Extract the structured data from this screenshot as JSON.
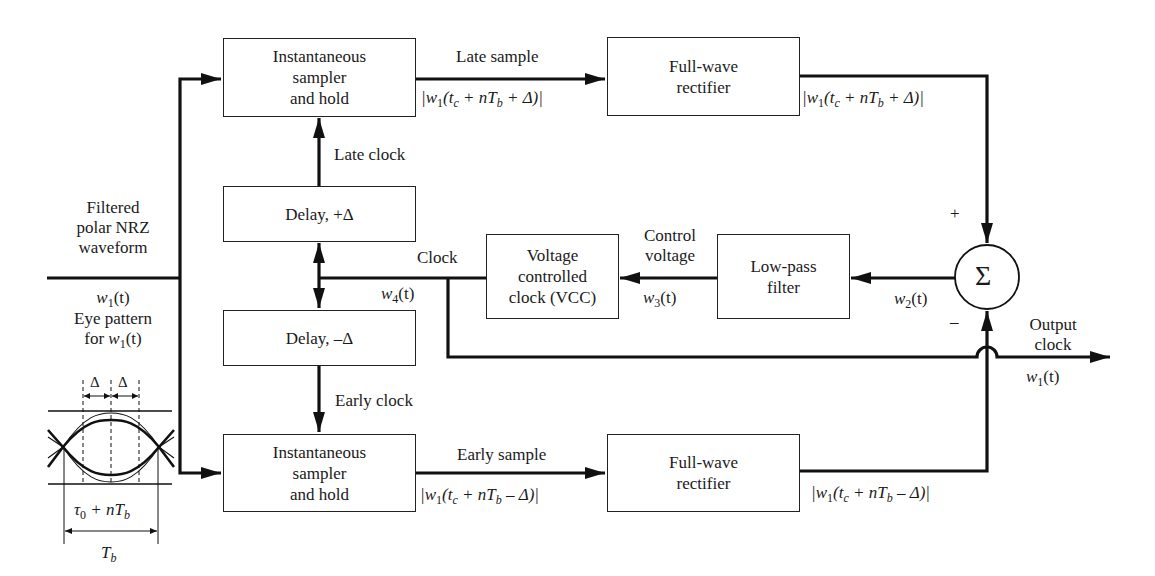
{
  "blocks": {
    "sampler_late": {
      "line1": "Instantaneous",
      "line2": "sampler",
      "line3": "and hold"
    },
    "rectifier_late": {
      "line1": "Full-wave",
      "line2": "rectifier"
    },
    "delay_plus": {
      "label": "Delay, +Δ"
    },
    "delay_minus": {
      "label": "Delay, –Δ"
    },
    "vcc": {
      "line1": "Voltage",
      "line2": "controlled",
      "line3": "clock (VCC)"
    },
    "lpf": {
      "line1": "Low-pass",
      "line2": "filter"
    },
    "summer": {
      "symbol": "Σ",
      "plus": "+",
      "minus": "–"
    },
    "sampler_early": {
      "line1": "Instantaneous",
      "line2": "sampler",
      "line3": "and hold"
    },
    "rectifier_early": {
      "line1": "Full-wave",
      "line2": "rectifier"
    }
  },
  "signals": {
    "input": {
      "line1": "Filtered",
      "line2": "polar NRZ",
      "line3": "waveform",
      "symbol": "w",
      "sub": "1",
      "arg": "(t)"
    },
    "late_sample": {
      "label": "Late sample",
      "expr_pre": "|w",
      "expr_sub": "1",
      "expr_mid": "(t",
      "expr_sub2": "c",
      "expr_post": " +  nT",
      "expr_sub3": "b",
      "expr_end": " + Δ)|"
    },
    "late_rect_out": {
      "expr_pre": "|w",
      "expr_sub": "1",
      "expr_mid": "(t",
      "expr_sub2": "c",
      "expr_post": " +  nT",
      "expr_sub3": "b",
      "expr_end": " + Δ)|"
    },
    "late_clock": {
      "label": "Late clock"
    },
    "early_clock": {
      "label": "Early clock"
    },
    "clock": {
      "label": "Clock",
      "symbol": "w",
      "sub": "4",
      "arg": "(t)"
    },
    "control_voltage": {
      "line1": "Control",
      "line2": "voltage",
      "symbol": "w",
      "sub": "3",
      "arg": "(t)"
    },
    "error": {
      "symbol": "w",
      "sub": "2",
      "arg": "(t)"
    },
    "output_clock": {
      "line1": "Output",
      "line2": "clock",
      "symbol": "w",
      "sub": "1",
      "arg": "(t)"
    },
    "early_sample": {
      "label": "Early sample",
      "expr_pre": "|w",
      "expr_sub": "1",
      "expr_mid": "(t",
      "expr_sub2": "c",
      "expr_post": " +  nT",
      "expr_sub3": "b",
      "expr_end": " – Δ)|"
    },
    "early_rect_out": {
      "expr_pre": "|w",
      "expr_sub": "1",
      "expr_mid": "(t",
      "expr_sub2": "c",
      "expr_post": " +  nT",
      "expr_sub3": "b",
      "expr_end": " – Δ)|"
    }
  },
  "eye_pattern": {
    "title_line1": "Eye pattern",
    "title_line2_pre": "for ",
    "symbol": "w",
    "sub": "1",
    "arg": "(t)",
    "delta_left": "Δ",
    "delta_right": "Δ",
    "tau_label_pre": "τ",
    "tau_sub": "0",
    "tau_label_post": " + nT",
    "tau_sub2": "b",
    "period_label": "T",
    "period_sub": "b"
  }
}
